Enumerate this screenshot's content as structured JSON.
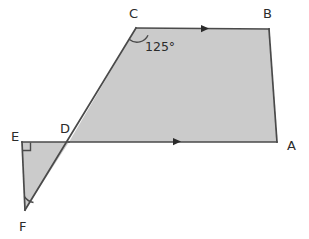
{
  "figure": {
    "background_color": "#ffffff",
    "fill_color": "#cbcbcb",
    "stroke_color": "#4a4a4a",
    "label_color": "#2b2b2b"
  },
  "vertices": [
    {
      "id": "C",
      "label": "C",
      "x": 136,
      "y": 28,
      "label_x": 129,
      "label_y": 18
    },
    {
      "id": "B",
      "label": "B",
      "x": 269,
      "y": 29,
      "label_x": 263,
      "label_y": 18
    },
    {
      "id": "A",
      "label": "A",
      "x": 277,
      "y": 142,
      "label_x": 287,
      "label_y": 150
    },
    {
      "id": "D",
      "label": "D",
      "x": 69,
      "y": 142,
      "label_x": 60,
      "label_y": 133
    },
    {
      "id": "E",
      "label": "E",
      "x": 22,
      "y": 142,
      "label_x": 11,
      "label_y": 141
    },
    {
      "id": "F",
      "label": "F",
      "x": 25,
      "y": 210,
      "label_x": 19,
      "label_y": 231
    }
  ],
  "shapes": [
    {
      "name": "quadrilateral-CBAD",
      "points": "136,28 269,29 277,142 69,142",
      "vertex_ids": [
        "C",
        "B",
        "A",
        "D"
      ]
    },
    {
      "name": "triangle-EDF",
      "points": "22,142 69,142 25,210",
      "vertex_ids": [
        "E",
        "D",
        "F"
      ]
    }
  ],
  "edges": [
    {
      "name": "edge-CB",
      "from": "C",
      "to": "B",
      "path": "M136,28 L269,29"
    },
    {
      "name": "edge-BA",
      "from": "B",
      "to": "A",
      "path": "M269,29 L277,142"
    },
    {
      "name": "edge-AD",
      "from": "A",
      "to": "D",
      "path": "M277,142 L69,142"
    },
    {
      "name": "edge-DE",
      "from": "D",
      "to": "E",
      "path": "M69,142 L22,142"
    },
    {
      "name": "edge-EF",
      "from": "E",
      "to": "F",
      "path": "M22,142 L25,210"
    },
    {
      "name": "edge-FC",
      "from": "F",
      "to": "C",
      "path": "M25,210 L136,28"
    }
  ],
  "angles": [
    {
      "id": "angle-C",
      "at_vertex": "C",
      "label": "125°",
      "label_x": 145,
      "label_y": 51,
      "arc_path": "M129.5,39.5 A12,12 0 0 0 148,35.2"
    },
    {
      "id": "angle-E",
      "at_vertex": "E",
      "label": "",
      "marker": "right-angle",
      "marker_path": "M22.5,150.5 L30.5,150.5 L30.5,142.5"
    },
    {
      "id": "angle-F",
      "at_vertex": "F",
      "label": "",
      "marker": "arc",
      "arc_path": "M24.3,196.5 A14,14 0 0 0 33.5,202.5"
    }
  ],
  "parallel_markers": [
    {
      "name": "arrow-marker-CB",
      "on_edge": "edge-CB",
      "x": 205,
      "y": 28.5,
      "direction": "right",
      "points": "201,25 209,28.6 201,32.2"
    },
    {
      "name": "arrow-marker-DA",
      "on_edge": "edge-AD",
      "x": 177,
      "y": 141.5,
      "direction": "right",
      "points": "173,138 181,141.6 173,145.2"
    }
  ]
}
